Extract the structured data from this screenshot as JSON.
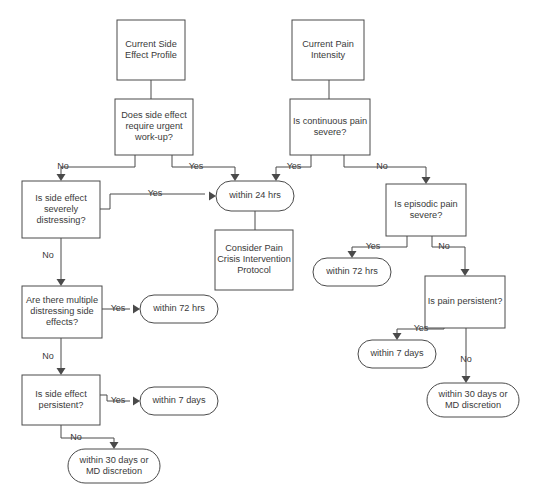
{
  "diagram": {
    "type": "flowchart",
    "background_color": "#ffffff",
    "stroke_color": "#4a4a4a",
    "text_color": "#3a3a3a",
    "nodes": [
      {
        "id": "current_side_effect_profile",
        "shape": "rect",
        "label": "Current Side\nEffect Profile",
        "x": 117,
        "y": 20,
        "w": 68,
        "h": 60
      },
      {
        "id": "does_side_effect_urgent",
        "shape": "rect",
        "label": "Does side effect\nrequire urgent\nwork-up?",
        "x": 115,
        "y": 99,
        "w": 78,
        "h": 56
      },
      {
        "id": "is_side_effect_distressing",
        "shape": "rect",
        "label": "Is side effect\nseverely\ndistressing?",
        "x": 22,
        "y": 181,
        "w": 78,
        "h": 57
      },
      {
        "id": "multiple_distressing_side_effects",
        "shape": "rect",
        "label": "Are there multiple\ndistressing side\neffects?",
        "x": 22,
        "y": 286,
        "w": 80,
        "h": 52
      },
      {
        "id": "is_side_effect_persistent",
        "shape": "rect",
        "label": "Is side effect\npersistent?",
        "x": 22,
        "y": 375,
        "w": 78,
        "h": 50
      },
      {
        "id": "current_pain_intensity",
        "shape": "rect",
        "label": "Current Pain\nIntensity",
        "x": 292,
        "y": 20,
        "w": 72,
        "h": 60
      },
      {
        "id": "is_continuous_pain_severe",
        "shape": "rect",
        "label": "Is continuous pain\nsevere?",
        "x": 290,
        "y": 99,
        "w": 80,
        "h": 56
      },
      {
        "id": "is_episodic_pain_severe",
        "shape": "rect",
        "label": "Is episodic pain\nsevere?",
        "x": 386,
        "y": 184,
        "w": 80,
        "h": 52
      },
      {
        "id": "is_pain_persistent",
        "shape": "rect",
        "label": "Is pain persistent?",
        "x": 425,
        "y": 276,
        "w": 80,
        "h": 52
      },
      {
        "id": "within_24_hrs",
        "shape": "terminator",
        "label": "within 24 hrs",
        "x": 216,
        "y": 181,
        "w": 78,
        "h": 30
      },
      {
        "id": "consider_pain_crisis_protocol",
        "shape": "rect",
        "label": "Consider Pain\nCrisis Intervention\nProtocol",
        "x": 215,
        "y": 230,
        "w": 78,
        "h": 60
      },
      {
        "id": "within_72_hrs_left",
        "shape": "terminator",
        "label": "within 72 hrs",
        "x": 140,
        "y": 295,
        "w": 78,
        "h": 28
      },
      {
        "id": "within_7_days_left",
        "shape": "terminator",
        "label": "within 7 days",
        "x": 140,
        "y": 387,
        "w": 78,
        "h": 28
      },
      {
        "id": "within_30_days_left",
        "shape": "terminator",
        "label": "within 30 days or\nMD discretion",
        "x": 68,
        "y": 449,
        "w": 92,
        "h": 34
      },
      {
        "id": "within_72_hrs_right",
        "shape": "terminator",
        "label": "within 72 hrs",
        "x": 313,
        "y": 258,
        "w": 78,
        "h": 28
      },
      {
        "id": "within_7_days_right",
        "shape": "terminator",
        "label": "within 7 days",
        "x": 358,
        "y": 340,
        "w": 78,
        "h": 28
      },
      {
        "id": "within_30_days_right",
        "shape": "terminator",
        "label": "within 30 days or\nMD discretion",
        "x": 427,
        "y": 383,
        "w": 92,
        "h": 34
      }
    ],
    "edge_labels": [
      {
        "id": "urgent_no",
        "text": "No",
        "x": 63,
        "y": 167
      },
      {
        "id": "urgent_yes",
        "text": "Yes",
        "x": 196,
        "y": 167
      },
      {
        "id": "distressing_yes",
        "text": "Yes",
        "x": 155,
        "y": 194
      },
      {
        "id": "distressing_no",
        "text": "No",
        "x": 48,
        "y": 256
      },
      {
        "id": "multiple_yes",
        "text": "Yes",
        "x": 118,
        "y": 309
      },
      {
        "id": "multiple_no",
        "text": "No",
        "x": 48,
        "y": 357
      },
      {
        "id": "persistent_yes_left",
        "text": "Yes",
        "x": 118,
        "y": 401
      },
      {
        "id": "persistent_no_left",
        "text": "No",
        "x": 76,
        "y": 438
      },
      {
        "id": "continuous_yes",
        "text": "Yes",
        "x": 294,
        "y": 167
      },
      {
        "id": "continuous_no",
        "text": "No",
        "x": 382,
        "y": 167
      },
      {
        "id": "episodic_yes",
        "text": "Yes",
        "x": 373,
        "y": 247
      },
      {
        "id": "episodic_no",
        "text": "No",
        "x": 444,
        "y": 247
      },
      {
        "id": "pain_persistent_yes",
        "text": "Yes",
        "x": 421,
        "y": 329
      },
      {
        "id": "pain_persistent_no",
        "text": "No",
        "x": 466,
        "y": 360
      }
    ]
  }
}
